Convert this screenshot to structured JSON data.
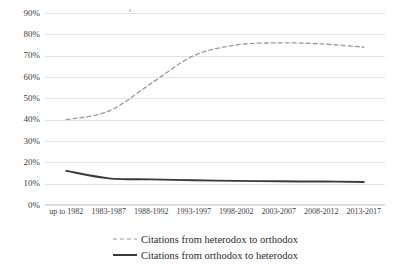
{
  "chart_data": {
    "type": "line",
    "title": "",
    "subtitle": "",
    "xlabel": "",
    "ylabel": "",
    "ylim": [
      0,
      90
    ],
    "ytick_step": 10,
    "grid": true,
    "legend_position": "bottom",
    "categories": [
      "up to 1982",
      "1983-1987",
      "1988-1992",
      "1993-1997",
      "1998-2002",
      "2003-2007",
      "2008-2012",
      "2013-2017"
    ],
    "ytick_labels": [
      "0%",
      "10%",
      "20%",
      "30%",
      "40%",
      "50%",
      "60%",
      "70%",
      "80%",
      "90%"
    ],
    "ytick_values": [
      0,
      10,
      20,
      30,
      40,
      50,
      60,
      70,
      80,
      90
    ],
    "series": [
      {
        "name": "Citations from heterodox to orthodox",
        "style": "dashed",
        "color": "#9a9a9a",
        "values": [
          40,
          44,
          57,
          70,
          75,
          76,
          75.5,
          74
        ]
      },
      {
        "name": "Citations from orthodox to heterodox",
        "style": "solid",
        "color": "#3a3a3a",
        "values": [
          16,
          12.5,
          12,
          11.6,
          11.3,
          11.1,
          11,
          10.8
        ]
      }
    ]
  },
  "legend": {
    "items": [
      {
        "label": "Citations from heterodox to orthodox",
        "style": "dashed",
        "color": "#9a9a9a"
      },
      {
        "label": "Citations from orthodox to heterodox",
        "style": "solid",
        "color": "#3a3a3a"
      }
    ]
  },
  "colors": {
    "gridline": "#e3e3e3",
    "axis": "#d9d9d9",
    "heterodox_to_orthodox": "#9a9a9a",
    "orthodox_to_heterodox": "#3a3a3a",
    "background": "#ffffff",
    "text": "#404040"
  }
}
